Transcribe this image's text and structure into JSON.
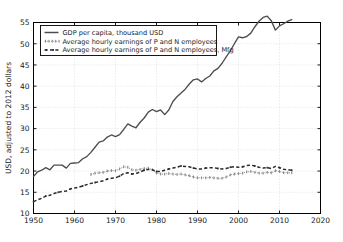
{
  "chart_data": {
    "type": "line",
    "title": "",
    "xlabel": "",
    "ylabel": "USD, adjusted to 2012 dollars",
    "xlim": [
      1950,
      2020
    ],
    "ylim": [
      10,
      55
    ],
    "xticks": [
      1950,
      1960,
      1970,
      1980,
      1990,
      2000,
      2010,
      2020
    ],
    "yticks": [
      10,
      15,
      20,
      25,
      30,
      35,
      40,
      45,
      50,
      55
    ],
    "grid": true,
    "legend_position": "upper left",
    "series": [
      {
        "name": "GDP per capita, thousand USD",
        "style": "solid",
        "color": "#4d4d4d",
        "x": [
          1950,
          1951,
          1952,
          1953,
          1954,
          1955,
          1956,
          1957,
          1958,
          1959,
          1960,
          1961,
          1962,
          1963,
          1964,
          1965,
          1966,
          1967,
          1968,
          1969,
          1970,
          1971,
          1972,
          1973,
          1974,
          1975,
          1976,
          1977,
          1978,
          1979,
          1980,
          1981,
          1982,
          1983,
          1984,
          1985,
          1986,
          1987,
          1988,
          1989,
          1990,
          1991,
          1992,
          1993,
          1994,
          1995,
          1996,
          1997,
          1998,
          1999,
          2000,
          2001,
          2002,
          2003,
          2004,
          2005,
          2006,
          2007,
          2008,
          2009,
          2010,
          2011,
          2012,
          2013
        ],
        "y": [
          18.7,
          19.8,
          20.2,
          20.8,
          20.3,
          21.4,
          21.4,
          21.4,
          20.7,
          21.8,
          21.9,
          22.0,
          22.9,
          23.4,
          24.4,
          25.6,
          26.8,
          27.1,
          28.0,
          28.5,
          28.1,
          28.6,
          29.8,
          31.1,
          30.6,
          30.2,
          31.5,
          32.5,
          33.9,
          34.5,
          34.0,
          34.4,
          33.3,
          34.4,
          36.4,
          37.5,
          38.4,
          39.3,
          40.5,
          41.5,
          41.7,
          41.0,
          41.8,
          42.4,
          43.6,
          44.2,
          45.4,
          46.9,
          48.3,
          50.0,
          51.6,
          51.4,
          51.7,
          52.5,
          54.0,
          55.3,
          56.2,
          56.5,
          55.4,
          53.2,
          54.2,
          54.7,
          55.3,
          55.7
        ]
      },
      {
        "name": "Average hourly earnings of P and N employees",
        "style": "dotted",
        "color": "#8a8a8a",
        "x": [
          1964,
          1965,
          1966,
          1967,
          1968,
          1969,
          1970,
          1971,
          1972,
          1973,
          1974,
          1975,
          1976,
          1977,
          1978,
          1979,
          1980,
          1981,
          1982,
          1983,
          1984,
          1985,
          1986,
          1987,
          1988,
          1989,
          1990,
          1991,
          1992,
          1993,
          1994,
          1995,
          1996,
          1997,
          1998,
          1999,
          2000,
          2001,
          2002,
          2003,
          2004,
          2005,
          2006,
          2007,
          2008,
          2009,
          2010,
          2011,
          2012,
          2013
        ],
        "y": [
          19.2,
          19.5,
          19.6,
          19.7,
          20.0,
          20.1,
          20.1,
          20.5,
          21.0,
          20.9,
          20.3,
          20.2,
          20.4,
          20.6,
          20.7,
          20.3,
          19.5,
          19.3,
          19.3,
          19.4,
          19.3,
          19.2,
          19.3,
          19.1,
          18.9,
          18.6,
          18.4,
          18.4,
          18.4,
          18.5,
          18.4,
          18.3,
          18.3,
          18.6,
          19.1,
          19.3,
          19.4,
          19.5,
          19.8,
          19.9,
          19.7,
          19.5,
          19.5,
          19.7,
          19.6,
          20.1,
          19.9,
          19.6,
          19.6,
          19.6
        ]
      },
      {
        "name": "Average hourly earnings of P and N employees, Mfg",
        "style": "dashed",
        "color": "#2b2b2b",
        "x": [
          1950,
          1951,
          1952,
          1953,
          1954,
          1955,
          1956,
          1957,
          1958,
          1959,
          1960,
          1961,
          1962,
          1963,
          1964,
          1965,
          1966,
          1967,
          1968,
          1969,
          1970,
          1971,
          1972,
          1973,
          1974,
          1975,
          1976,
          1977,
          1978,
          1979,
          1980,
          1981,
          1982,
          1983,
          1984,
          1985,
          1986,
          1987,
          1988,
          1989,
          1990,
          1991,
          1992,
          1993,
          1994,
          1995,
          1996,
          1997,
          1998,
          1999,
          2000,
          2001,
          2002,
          2003,
          2004,
          2005,
          2006,
          2007,
          2008,
          2009,
          2010,
          2011,
          2012,
          2013
        ],
        "y": [
          12.8,
          13.2,
          13.6,
          14.1,
          14.3,
          14.7,
          15.0,
          15.2,
          15.3,
          15.8,
          16.0,
          16.2,
          16.5,
          16.8,
          17.1,
          17.3,
          17.5,
          17.7,
          18.1,
          18.3,
          18.4,
          18.8,
          19.4,
          19.6,
          19.3,
          19.4,
          19.8,
          20.2,
          20.4,
          20.3,
          19.9,
          19.9,
          20.2,
          20.5,
          20.7,
          20.9,
          21.2,
          21.1,
          21.0,
          20.7,
          20.5,
          20.5,
          20.7,
          20.8,
          20.8,
          20.6,
          20.5,
          20.6,
          20.9,
          21.0,
          20.9,
          21.0,
          21.3,
          21.4,
          21.2,
          20.9,
          20.7,
          20.8,
          20.6,
          21.1,
          20.8,
          20.4,
          20.3,
          20.2
        ]
      }
    ]
  },
  "legend": {
    "entries": [
      "GDP per capita, thousand USD",
      "Average hourly earnings of P and N employees",
      "Average hourly earnings of P and N employees, Mfg"
    ]
  },
  "axes": {
    "ylabel": "USD, adjusted to 2012 dollars",
    "xtick_labels": [
      "1950",
      "1960",
      "1970",
      "1980",
      "1990",
      "2000",
      "2010",
      "2020"
    ],
    "ytick_labels": [
      "10",
      "15",
      "20",
      "25",
      "30",
      "35",
      "40",
      "45",
      "50",
      "55"
    ]
  }
}
